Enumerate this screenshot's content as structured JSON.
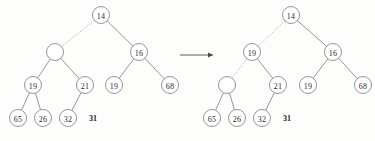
{
  "figure": {
    "background_color": "#fdfdfc",
    "stroke_color": "#8a8a88",
    "text_color": "#2b2b2b",
    "node_radius": 8.5,
    "transform_arrow": {
      "symbol": "→",
      "x1": 180,
      "y1": 55,
      "x2": 213,
      "y2": 55
    }
  },
  "left_tree": {
    "name": "before",
    "nodes": [
      {
        "id": "L-14",
        "label": "14",
        "x": 101,
        "y": 15,
        "empty": false
      },
      {
        "id": "L-empty",
        "label": "",
        "x": 55,
        "y": 52,
        "empty": true
      },
      {
        "id": "L-16",
        "label": "16",
        "x": 139,
        "y": 52,
        "empty": false
      },
      {
        "id": "L-19a",
        "label": "19",
        "x": 33,
        "y": 85,
        "empty": false
      },
      {
        "id": "L-21",
        "label": "21",
        "x": 85,
        "y": 85,
        "empty": false
      },
      {
        "id": "L-19b",
        "label": "19",
        "x": 114,
        "y": 85,
        "empty": false
      },
      {
        "id": "L-68",
        "label": "68",
        "x": 170,
        "y": 85,
        "empty": false
      },
      {
        "id": "L-65",
        "label": "65",
        "x": 18,
        "y": 118,
        "empty": false
      },
      {
        "id": "L-26",
        "label": "26",
        "x": 43,
        "y": 118,
        "empty": false
      },
      {
        "id": "L-32",
        "label": "32",
        "x": 68,
        "y": 118,
        "empty": false
      }
    ],
    "edges": [
      {
        "from": "L-14",
        "to": "L-empty",
        "style": "dotted"
      },
      {
        "from": "L-14",
        "to": "L-16",
        "style": "solid"
      },
      {
        "from": "L-empty",
        "to": "L-19a",
        "style": "solid"
      },
      {
        "from": "L-empty",
        "to": "L-21",
        "style": "solid"
      },
      {
        "from": "L-16",
        "to": "L-19b",
        "style": "solid"
      },
      {
        "from": "L-16",
        "to": "L-68",
        "style": "solid"
      },
      {
        "from": "L-19a",
        "to": "L-65",
        "style": "solid"
      },
      {
        "from": "L-19a",
        "to": "L-26",
        "style": "solid"
      },
      {
        "from": "L-21",
        "to": "L-32",
        "style": "solid"
      }
    ],
    "free_labels": [
      {
        "id": "L-31",
        "label": "31",
        "x": 93,
        "y": 118
      }
    ]
  },
  "right_tree": {
    "name": "after",
    "nodes": [
      {
        "id": "R-14",
        "label": "14",
        "x": 291,
        "y": 15,
        "empty": false
      },
      {
        "id": "R-19a",
        "label": "19",
        "x": 252,
        "y": 52,
        "empty": false
      },
      {
        "id": "R-16",
        "label": "16",
        "x": 333,
        "y": 52,
        "empty": false
      },
      {
        "id": "R-empty",
        "label": "",
        "x": 227,
        "y": 85,
        "empty": true
      },
      {
        "id": "R-21",
        "label": "21",
        "x": 278,
        "y": 85,
        "empty": false
      },
      {
        "id": "R-19b",
        "label": "19",
        "x": 308,
        "y": 85,
        "empty": false
      },
      {
        "id": "R-68",
        "label": "68",
        "x": 363,
        "y": 85,
        "empty": false
      },
      {
        "id": "R-65",
        "label": "65",
        "x": 212,
        "y": 118,
        "empty": false
      },
      {
        "id": "R-26",
        "label": "26",
        "x": 237,
        "y": 118,
        "empty": false
      },
      {
        "id": "R-32",
        "label": "32",
        "x": 262,
        "y": 118,
        "empty": false
      }
    ],
    "edges": [
      {
        "from": "R-14",
        "to": "R-19a",
        "style": "dotted"
      },
      {
        "from": "R-14",
        "to": "R-16",
        "style": "solid"
      },
      {
        "from": "R-19a",
        "to": "R-empty",
        "style": "dotted"
      },
      {
        "from": "R-19a",
        "to": "R-21",
        "style": "solid"
      },
      {
        "from": "R-16",
        "to": "R-19b",
        "style": "solid"
      },
      {
        "from": "R-16",
        "to": "R-68",
        "style": "solid"
      },
      {
        "from": "R-empty",
        "to": "R-65",
        "style": "solid"
      },
      {
        "from": "R-empty",
        "to": "R-26",
        "style": "solid"
      },
      {
        "from": "R-21",
        "to": "R-32",
        "style": "solid"
      }
    ],
    "free_labels": [
      {
        "id": "R-31",
        "label": "31",
        "x": 287,
        "y": 118
      }
    ]
  }
}
